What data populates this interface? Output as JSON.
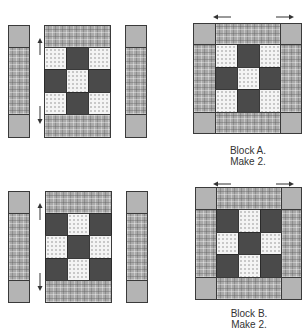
{
  "diagram": {
    "type": "quilt block assembly",
    "fabrics": {
      "plaid": "#a9a9a9",
      "solid_gray": "#b4b4b4",
      "dark": "#4a4a4a",
      "light_print": "#f4f4f4"
    },
    "blocks": [
      {
        "id": "A",
        "caption_line1": "Block A.",
        "caption_line2": "Make 2.",
        "nine_patch": [
          [
            "light",
            "dark",
            "light"
          ],
          [
            "dark",
            "light",
            "dark"
          ],
          [
            "light",
            "dark",
            "light"
          ]
        ],
        "pressing_arrows": [
          "up-left side",
          "down-left side",
          "left-top",
          "right-top"
        ]
      },
      {
        "id": "B",
        "caption_line1": "Block B.",
        "caption_line2": "Make 2.",
        "nine_patch": [
          [
            "dark",
            "light",
            "dark"
          ],
          [
            "light",
            "dark",
            "light"
          ],
          [
            "dark",
            "light",
            "dark"
          ]
        ],
        "pressing_arrows": [
          "up-left side",
          "down-left side",
          "left-top",
          "right-top"
        ]
      }
    ]
  }
}
